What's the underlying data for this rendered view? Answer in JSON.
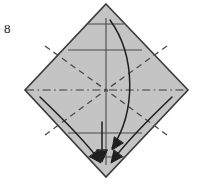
{
  "figure": {
    "kind": "origami-fold-diagram",
    "step_number": "8",
    "canvas": {
      "width": 199,
      "height": 184,
      "background": "#ffffff"
    }
  },
  "colors": {
    "paper_fill": "#c4c4c4",
    "paper_edge": "#3a3a3a",
    "crease_solid": "#4a4a4a",
    "crease_dashed": "#4a4a4a",
    "axis_dashdot": "#3a3a3a",
    "arrow": "#1e1e1e",
    "label_text": "#1a1a1a"
  },
  "paper": {
    "name": "diamond-sheet",
    "vertices": {
      "top": {
        "x": 106,
        "y": 4
      },
      "right": {
        "x": 188,
        "y": 90
      },
      "bottom": {
        "x": 106,
        "y": 177
      },
      "left": {
        "x": 25,
        "y": 90
      }
    },
    "edge_width": 1.6
  },
  "creases": {
    "horizontal_solid": [
      {
        "name": "crease-top-short",
        "x1": 88,
        "y1": 24,
        "x2": 124,
        "y2": 24
      },
      {
        "name": "crease-upper-wide",
        "x1": 68,
        "y1": 50,
        "x2": 142,
        "y2": 50
      },
      {
        "name": "crease-lower-wide",
        "x1": 68,
        "y1": 133,
        "x2": 142,
        "y2": 133
      },
      {
        "name": "crease-bottom-short",
        "x1": 88,
        "y1": 157,
        "x2": 124,
        "y2": 157
      }
    ],
    "vertical_solid": [
      {
        "name": "crease-center-vertical",
        "x1": 106,
        "y1": 18,
        "x2": 106,
        "y2": 165
      }
    ],
    "dashdot_axis": [
      {
        "name": "axis-horizontal-center",
        "x1": 26,
        "y1": 90,
        "x2": 187,
        "y2": 90
      }
    ],
    "dashed_diagonals": [
      {
        "name": "crease-diagonal-tl",
        "x1": 45,
        "y1": 46,
        "x2": 106,
        "y2": 90
      },
      {
        "name": "crease-diagonal-tr",
        "x1": 167,
        "y1": 46,
        "x2": 106,
        "y2": 90
      },
      {
        "name": "crease-diagonal-bl",
        "x1": 45,
        "y1": 135,
        "x2": 106,
        "y2": 90
      },
      {
        "name": "crease-diagonal-br",
        "x1": 167,
        "y1": 135,
        "x2": 106,
        "y2": 90
      }
    ]
  },
  "arrows": [
    {
      "name": "arrow-top-to-bottom",
      "note": "Long curved arrow from the top point sweeping right and down to the bottom point",
      "path": "M 110 20 C 136 56, 136 112, 112 148",
      "head_at": {
        "x": 112,
        "y": 150
      },
      "head_angle_deg": 124
    },
    {
      "name": "arrow-left-to-bottom",
      "note": "Curved arrow from the left point down to the bottom centre",
      "path": "M 40 97 C 62 118, 84 140, 100 161",
      "head_at": {
        "x": 101,
        "y": 163
      },
      "head_angle_deg": 53
    },
    {
      "name": "arrow-right-to-bottom",
      "note": "Curved arrow from the right point down to the bottom centre",
      "path": "M 172 97 C 150 118, 128 140, 112 161",
      "head_at": {
        "x": 111,
        "y": 163
      },
      "head_angle_deg": 127
    },
    {
      "name": "arrow-center-down",
      "note": "Straight vertical arrow along the centre line to the bottom point",
      "path": "M 102 122 L 102 160",
      "head_at": {
        "x": 102,
        "y": 162
      },
      "head_angle_deg": 90
    }
  ],
  "label": {
    "name": "step-number",
    "text": "8",
    "position": {
      "x": 4,
      "y": 22
    }
  }
}
